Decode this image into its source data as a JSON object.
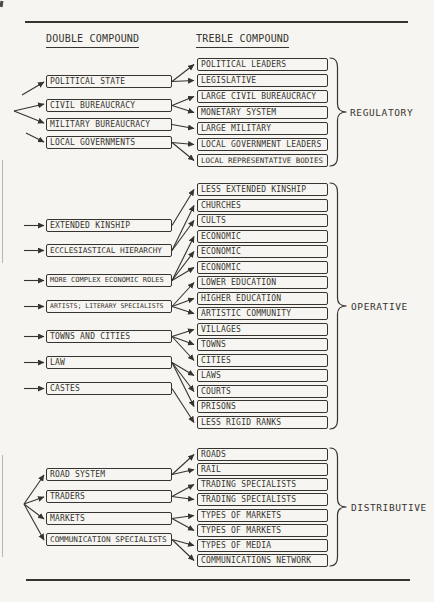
{
  "headers": {
    "double": "DOUBLE COMPOUND",
    "treble": "TREBLE COMPOUND"
  },
  "sections": {
    "regulatory": {
      "label": "REGULATORY",
      "left": [
        "POLITICAL STATE",
        "CIVIL BUREAUCRACY",
        "MILITARY BUREAUCRACY",
        "LOCAL GOVERNMENTS"
      ],
      "right": [
        "POLITICAL LEADERS",
        "LEGISLATIVE",
        "LARGE CIVIL BUREAUCRACY",
        "MONETARY SYSTEM",
        "LARGE MILITARY",
        "LOCAL GOVERNMENT LEADERS",
        "LOCAL REPRESENTATIVE BODIES"
      ],
      "links": [
        [
          0,
          [
            0,
            1
          ]
        ],
        [
          1,
          [
            2,
            3
          ]
        ],
        [
          2,
          [
            4
          ]
        ],
        [
          3,
          [
            5,
            6
          ]
        ]
      ]
    },
    "operative": {
      "label": "OPERATIVE",
      "left": [
        "EXTENDED KINSHIP",
        "ECCLESIASTICAL HIERARCHY",
        "MORE COMPLEX ECONOMIC ROLES",
        "ARTISTS; LITERARY SPECIALISTS",
        "TOWNS AND CITIES",
        "LAW",
        "CASTES"
      ],
      "right": [
        "LESS EXTENDED KINSHIP",
        "CHURCHES",
        "CULTS",
        "ECONOMIC",
        "ECONOMIC",
        "ECONOMIC",
        "LOWER EDUCATION",
        "HIGHER EDUCATION",
        "ARTISTIC COMMUNITY",
        "VILLAGES",
        "TOWNS",
        "CITIES",
        "LAWS",
        "COURTS",
        "PRISONS",
        "LESS RIGID RANKS"
      ],
      "links": [
        [
          0,
          [
            0
          ]
        ],
        [
          1,
          [
            1,
            2
          ]
        ],
        [
          2,
          [
            3,
            4,
            5
          ]
        ],
        [
          3,
          [
            6,
            7,
            8
          ]
        ],
        [
          4,
          [
            9,
            10,
            11
          ]
        ],
        [
          5,
          [
            12,
            13,
            14
          ]
        ],
        [
          6,
          [
            15
          ]
        ]
      ]
    },
    "distributive": {
      "label": "DISTRIBUTIVE",
      "left": [
        "ROAD SYSTEM",
        "TRADERS",
        "MARKETS",
        "COMMUNICATION SPECIALISTS"
      ],
      "right": [
        "ROADS",
        "RAIL",
        "TRADING SPECIALISTS",
        "TRADING SPECIALISTS",
        "TYPES OF MARKETS",
        "TYPES OF MARKETS",
        "TYPES OF MEDIA",
        "COMMUNICATIONS NETWORK"
      ],
      "links": [
        [
          0,
          [
            0,
            1
          ]
        ],
        [
          1,
          [
            2,
            3
          ]
        ],
        [
          2,
          [
            4,
            5
          ]
        ],
        [
          3,
          [
            6,
            7
          ]
        ]
      ]
    }
  },
  "colors": {
    "ink": "#37342f",
    "paper": "#f6f5f1"
  }
}
